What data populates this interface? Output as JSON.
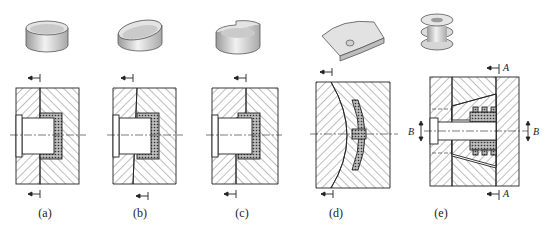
{
  "figure": {
    "panels": [
      {
        "id": "a",
        "label": "(a)",
        "label_x": 45,
        "part": "straight cylindrical ring",
        "parting": "straight vertical parting line"
      },
      {
        "id": "b",
        "label": "(b)",
        "label_x": 140,
        "part": "ring with inclined rim",
        "parting": "inclined parting line"
      },
      {
        "id": "c",
        "label": "(c)",
        "label_x": 242,
        "part": "ring with stepped rim",
        "parting": "stepped parting line"
      },
      {
        "id": "d",
        "label": "(d)",
        "label_x": 336,
        "part": "curved saddle plate with boss",
        "parting": "curved parting surface"
      },
      {
        "id": "e",
        "label": "(e)",
        "label_x": 441,
        "part": "grooved pulley",
        "parting": "split cavity with side cores"
      }
    ],
    "section_labels": {
      "A_top": "A",
      "A_bottom": "A",
      "B_left": "B",
      "B_right": "B"
    },
    "colors": {
      "line": "#222222",
      "hatch": "#444444",
      "part_fill": "#cfcfcf",
      "background": "#ffffff"
    }
  }
}
